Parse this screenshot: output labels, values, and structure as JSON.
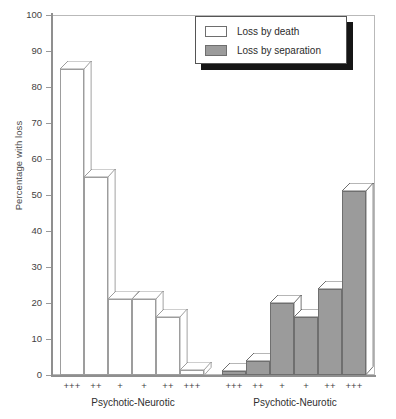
{
  "chart_data": {
    "type": "bar",
    "title": "",
    "xlabel": "",
    "ylabel": "Percentage with loss",
    "ylim": [
      0,
      100
    ],
    "ytick_labels": [
      "100",
      "90",
      "80",
      "70",
      "60",
      "50",
      "40",
      "30",
      "20",
      "10",
      "0"
    ],
    "ytick_values": [
      100,
      90,
      80,
      70,
      60,
      50,
      40,
      30,
      20,
      10,
      0
    ],
    "grid": false,
    "legend_position": "top-right",
    "legend": [
      "Loss by death",
      "Loss by separation"
    ],
    "colors": {
      "loss_by_death": "#ffffff",
      "loss_by_separation": "#9b9b9b",
      "bar_outline": "#9d9d9d",
      "axis": "#8f8f8f",
      "legend_shadow": "#151515"
    },
    "categories": [
      "+++",
      "++",
      "+",
      "+",
      "++",
      "+++"
    ],
    "groups": [
      {
        "name": "Loss by death",
        "axis_group_label": "Psychotic-Neurotic",
        "categories": [
          "+++",
          "++",
          "+",
          "+",
          "++",
          "+++"
        ],
        "values": [
          85,
          55,
          21,
          21,
          16,
          1.5
        ]
      },
      {
        "name": "Loss by separation",
        "axis_group_label": "Psychotic-Neurotic",
        "categories": [
          "+++",
          "++",
          "+",
          "+",
          "++",
          "+++"
        ],
        "values": [
          1,
          4,
          20,
          16,
          24,
          51
        ]
      }
    ]
  },
  "axis": {
    "y_label": "Percentage with loss",
    "y_ticks": [
      "100",
      "90",
      "80",
      "70",
      "60",
      "50",
      "40",
      "30",
      "20",
      "10",
      "0"
    ],
    "x_ticks_group1": [
      "+++",
      "++",
      "+",
      "+",
      "++",
      "+++"
    ],
    "x_ticks_group2": [
      "+++",
      "++",
      "+",
      "+",
      "++",
      "+++"
    ],
    "group1_label": "Psychotic-Neurotic",
    "group2_label": "Psychotic-Neurotic"
  },
  "legend": {
    "items": [
      {
        "label": "Loss by death",
        "swatch": "white"
      },
      {
        "label": "Loss by separation",
        "swatch": "gray"
      }
    ]
  }
}
